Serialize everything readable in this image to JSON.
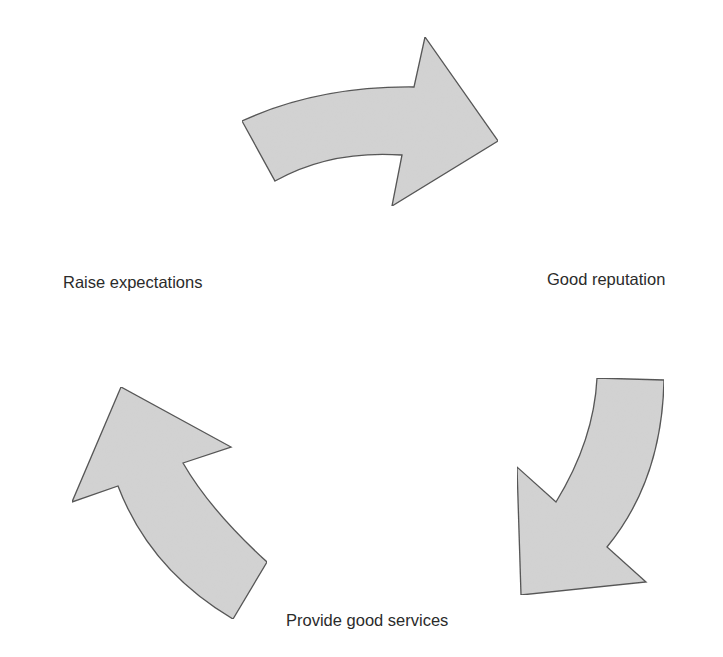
{
  "diagram": {
    "type": "cycle",
    "fill_color": "#d3d3d3",
    "stroke_color": "#4f4f4f",
    "nodes": [
      {
        "id": "raise",
        "label": "Raise expectations"
      },
      {
        "id": "reputation",
        "label": "Good reputation"
      },
      {
        "id": "services",
        "label": "Provide good services"
      }
    ],
    "edges": [
      {
        "from": "Raise expectations",
        "to": "Good reputation",
        "icon": "curved-arrow-right"
      },
      {
        "from": "Good reputation",
        "to": "Provide good services",
        "icon": "curved-arrow-down-left"
      },
      {
        "from": "Provide good services",
        "to": "Raise expectations",
        "icon": "curved-arrow-up-left"
      }
    ]
  }
}
